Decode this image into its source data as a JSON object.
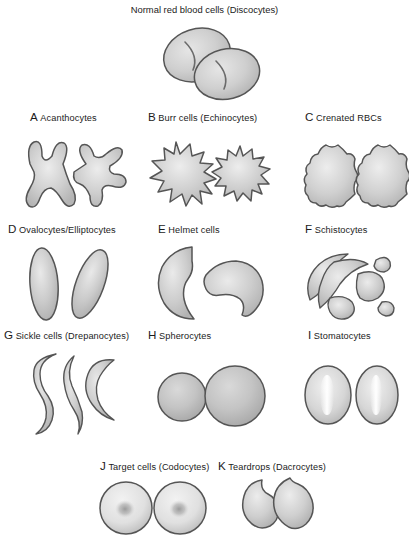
{
  "figure": {
    "title": "Normal red blood cells (Discocytes)",
    "background_color": "#ffffff",
    "cell_fill_color": "#c9c9c9",
    "cell_outline_color": "#555555",
    "cell_highlight_color": "#eeeeee",
    "text_color": "#1b1b1b"
  },
  "panels": [
    {
      "letter": "A",
      "name": "Acanthocytes",
      "label": "Acanthocytes",
      "cell_count": 2,
      "description": "Cells with irregular, unevenly spaced blunt spicules"
    },
    {
      "letter": "B",
      "name": "Burr cells",
      "label": "Burr cells (Echinocytes)",
      "cell_count": 2,
      "description": "Cells with many short, evenly spaced spicules"
    },
    {
      "letter": "C",
      "name": "Crenated RBCs",
      "label": "Crenated RBCs",
      "cell_count": 2,
      "description": "Round cells with gently scalloped margins"
    },
    {
      "letter": "D",
      "name": "Ovalocytes/Elliptocytes",
      "label": "Ovalocytes/Elliptocytes",
      "cell_count": 2,
      "description": "Elongated oval and cigar-shaped cells"
    },
    {
      "letter": "E",
      "name": "Helmet cells",
      "label": "Helmet cells",
      "cell_count": 2,
      "description": "Cells with a bite-like notch giving a helmet outline"
    },
    {
      "letter": "F",
      "name": "Schistocytes",
      "label": "Schistocytes",
      "cell_count": 5,
      "description": "Irregular angular red cell fragments"
    },
    {
      "letter": "G",
      "name": "Sickle cells",
      "label": "Sickle cells (Drepanocytes)",
      "cell_count": 3,
      "description": "Crescent and S-shaped elongated cells with pointed ends"
    },
    {
      "letter": "H",
      "name": "Spherocytes",
      "label": "Spherocytes",
      "cell_count": 2,
      "description": "Dense round cells lacking central pallor"
    },
    {
      "letter": "I",
      "name": "Stomatocytes",
      "label": "Stomatocytes",
      "cell_count": 2,
      "description": "Cells with a slit-like central pallor"
    },
    {
      "letter": "J",
      "name": "Target cells",
      "label": "Target cells (Codocytes)",
      "cell_count": 2,
      "description": "Cells with a dark central bullseye of hemoglobin"
    },
    {
      "letter": "K",
      "name": "Teardrops",
      "label": "Teardrops (Dacrocytes)",
      "cell_count": 2,
      "description": "Cells with a rounded body and a single pointed tail"
    }
  ]
}
